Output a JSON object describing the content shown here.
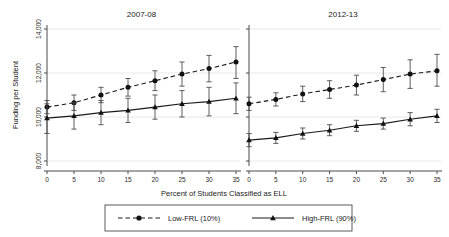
{
  "chart_data": {
    "type": "line",
    "title": "",
    "xlabel": "Percent of Students Classified as ELL",
    "ylabel": "Funding per Student",
    "xlim": [
      -2,
      37
    ],
    "ylim": [
      7400,
      14600
    ],
    "xticks": [
      0,
      5,
      10,
      15,
      20,
      25,
      30,
      35
    ],
    "yticks": [
      8000,
      10000,
      12000,
      14000
    ],
    "ytick_labels": [
      "8,000",
      "10,000",
      "12,000",
      "14,000"
    ],
    "grid": "horizontal",
    "legend_position": "bottom",
    "panels": [
      {
        "title": "2007-08",
        "x": [
          0,
          5,
          10,
          15,
          20,
          25,
          30,
          35
        ],
        "series": [
          {
            "name": "Low-FRL (10%)",
            "marker": "circle",
            "line": "dashed",
            "values": [
              10450,
              10650,
              11000,
              11350,
              11650,
              11950,
              12200,
              12500
            ],
            "err_low": [
              10150,
              10300,
              10650,
              10950,
              11200,
              11400,
              11600,
              11750
            ],
            "err_high": [
              10750,
              11000,
              11350,
              11750,
              12100,
              12500,
              12800,
              13200
            ]
          },
          {
            "name": "High-FRL (90%)",
            "marker": "triangle",
            "line": "solid",
            "values": [
              9950,
              10050,
              10200,
              10300,
              10450,
              10600,
              10700,
              10850
            ],
            "err_low": [
              9250,
              9450,
              9650,
              9750,
              9900,
              10000,
              10050,
              10150
            ],
            "err_high": [
              10600,
              10650,
              10750,
              10850,
              11000,
              11200,
              11350,
              11550
            ]
          }
        ]
      },
      {
        "title": "2012-13",
        "x": [
          0,
          5,
          10,
          15,
          20,
          25,
          30,
          35
        ],
        "series": [
          {
            "name": "Low-FRL (10%)",
            "marker": "circle",
            "line": "dashed",
            "values": [
              10600,
              10800,
              11050,
              11250,
              11450,
              11700,
              11950,
              12100
            ],
            "err_low": [
              10300,
              10500,
              10700,
              10850,
              11000,
              11150,
              11300,
              11400
            ],
            "err_high": [
              10900,
              11100,
              11400,
              11650,
              11900,
              12250,
              12600,
              12850
            ]
          },
          {
            "name": "High-FRL (90%)",
            "marker": "triangle",
            "line": "solid",
            "values": [
              8950,
              9050,
              9250,
              9400,
              9600,
              9700,
              9900,
              10050
            ],
            "err_low": [
              8650,
              8800,
              9000,
              9150,
              9350,
              9450,
              9600,
              9750
            ],
            "err_high": [
              9250,
              9300,
              9500,
              9650,
              9850,
              9950,
              10200,
              10350
            ]
          }
        ]
      }
    ],
    "legend": [
      {
        "label": "Low-FRL (10%)",
        "marker": "circle",
        "line": "dashed"
      },
      {
        "label": "High-FRL (90%)",
        "marker": "triangle",
        "line": "solid"
      }
    ]
  }
}
